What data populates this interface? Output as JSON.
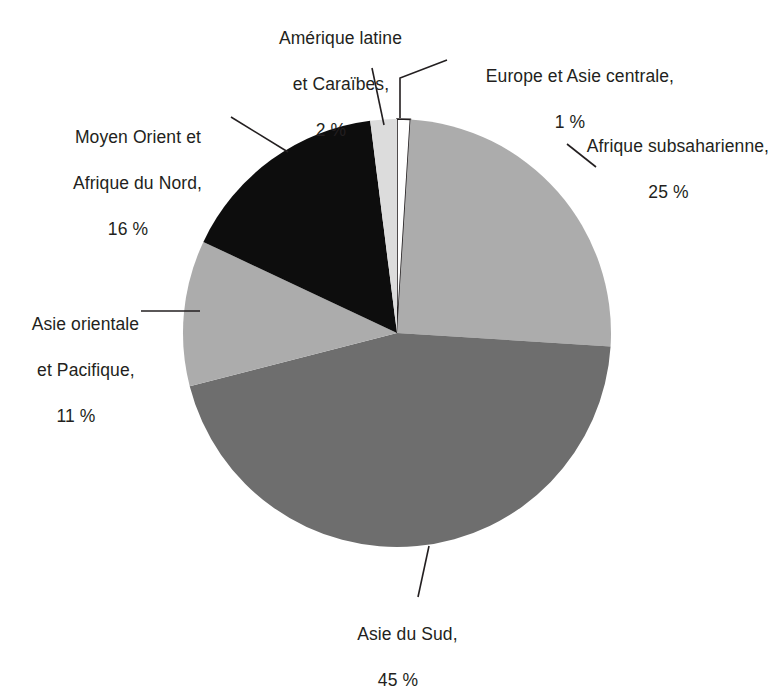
{
  "figure": {
    "title": "",
    "background": "#ffffff",
    "text_color": "#231f20"
  },
  "chart_data": {
    "type": "pie",
    "title": "",
    "xlabel": "",
    "ylabel": "",
    "legend_position": "callout-labels",
    "grid": false,
    "units": "percent",
    "start_angle_deg": 0,
    "direction": "clockwise",
    "categories": [
      "Europe et Asie centrale",
      "Afrique subsaharienne",
      "Asie du Sud",
      "Asie orientale et Pacifique",
      "Moyen Orient et Afrique du Nord",
      "Amérique latine et Caraïbes"
    ],
    "values": [
      1,
      25,
      45,
      11,
      16,
      2
    ],
    "value_labels": [
      "1 %",
      "25 %",
      "45 %",
      "11 %",
      "16 %",
      "2 %"
    ],
    "colors": [
      "#ffffff",
      "#acacac",
      "#6e6e6e",
      "#acacac",
      "#0d0d0d",
      "#dcdcdc"
    ]
  },
  "labels": {
    "latam": {
      "line1": "Amérique latine",
      "line2": "et Caraïbes,",
      "pct": "2 %"
    },
    "europe": {
      "line1": "Europe et Asie centrale,",
      "pct": "1 %"
    },
    "ssa": {
      "line1": "Afrique subsaharienne,",
      "pct": "25 %"
    },
    "mena": {
      "line1": "Moyen Orient et",
      "line2": "Afrique du Nord,",
      "pct": "16 %"
    },
    "eap": {
      "line1": "Asie orientale",
      "line2": "et Pacifique,",
      "pct": "11 %"
    },
    "sa": {
      "line1": "Asie du Sud,",
      "pct": "45 %"
    }
  }
}
